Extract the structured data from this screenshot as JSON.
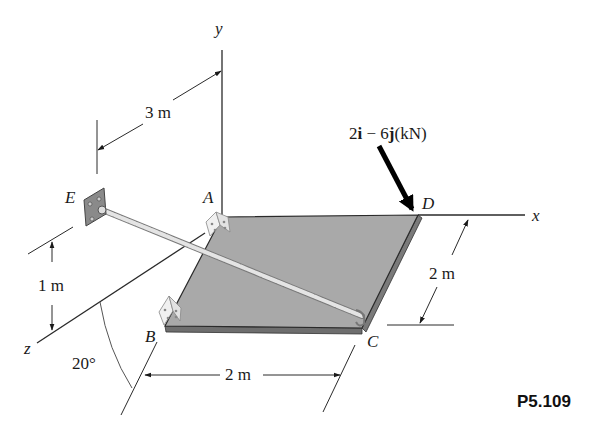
{
  "figure": {
    "id": "P5.109"
  },
  "axes": {
    "x": "x",
    "y": "y",
    "z": "z"
  },
  "points": {
    "A": "A",
    "B": "B",
    "C": "C",
    "D": "D",
    "E": "E"
  },
  "dimensions": {
    "EA_offset": "3 m",
    "E_height": "1 m",
    "BC_length": "2 m",
    "DC_length": "2 m",
    "angle": "20°"
  },
  "load": {
    "i_coef": "2",
    "i": "i",
    "minus": " − ",
    "j_coef": "6",
    "j": "j",
    "unit": "(kN)"
  },
  "colors": {
    "plate_top": "#a9a9a9",
    "plate_edge": "#6e6e6e",
    "line": "#2a2a2a",
    "cable": "#d9d9d9"
  }
}
